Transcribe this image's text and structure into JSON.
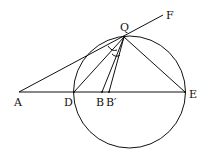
{
  "labels": {
    "A": "A",
    "D": "D",
    "B": "B",
    "B_prime": "B′",
    "E": "E",
    "Q": "Q",
    "F": "F"
  },
  "points": {
    "A": [
      19,
      92
    ],
    "D": [
      74,
      92
    ],
    "B": [
      102,
      92
    ],
    "B_prime": [
      109,
      92
    ],
    "E": [
      185,
      92
    ],
    "Q": [
      124,
      37
    ],
    "F": [
      163,
      15
    ]
  },
  "circle": {
    "cx": 129.5,
    "cy": 92,
    "r": 56
  },
  "colors": {
    "stroke": "#111111",
    "background": "#ffffff"
  }
}
